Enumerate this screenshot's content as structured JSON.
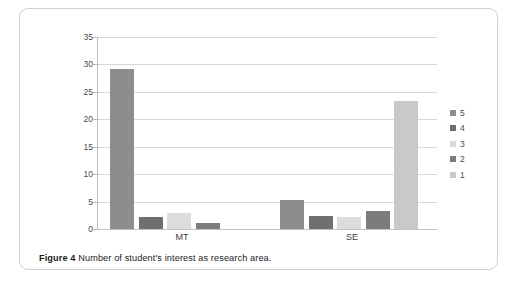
{
  "caption": {
    "label": "Figure 4",
    "text": " Number of student's interest as research area."
  },
  "chart_data": {
    "type": "bar",
    "title": "",
    "xlabel": "",
    "ylabel": "",
    "categories": [
      "MT",
      "SE"
    ],
    "ylim": [
      0,
      35
    ],
    "yticks": [
      0,
      5,
      10,
      15,
      20,
      25,
      30,
      35
    ],
    "ytick_labels": [
      "0",
      "5",
      "10",
      "15",
      "20",
      "25",
      "30",
      "35"
    ],
    "grid": true,
    "legend_position": "right",
    "series": [
      {
        "name": "5",
        "color": "#8d8d8d",
        "values": [
          29.1,
          5.2
        ]
      },
      {
        "name": "4",
        "color": "#6f6f6f",
        "values": [
          2.1,
          2.3
        ]
      },
      {
        "name": "3",
        "color": "#dcdcdc",
        "values": [
          3.0,
          2.2
        ]
      },
      {
        "name": "2",
        "color": "#7c7c7c",
        "values": [
          1.1,
          3.2
        ]
      },
      {
        "name": "1",
        "color": "#c9c9c9",
        "values": [
          0,
          23.3
        ]
      }
    ]
  },
  "legend": {
    "items": [
      {
        "label": "5",
        "color": "#8d8d8d"
      },
      {
        "label": "4",
        "color": "#6f6f6f"
      },
      {
        "label": "3",
        "color": "#dcdcdc"
      },
      {
        "label": "2",
        "color": "#7c7c7c"
      },
      {
        "label": "1",
        "color": "#c9c9c9"
      }
    ]
  }
}
